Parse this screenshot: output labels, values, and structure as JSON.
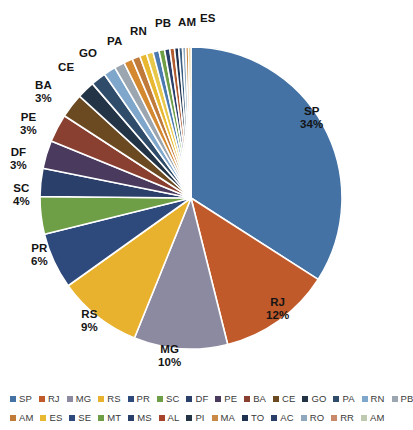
{
  "chart_data": {
    "type": "pie",
    "title": "",
    "subtitle": "",
    "xlabel": "",
    "ylabel": "",
    "legend_position": "bottom",
    "grid": false,
    "units": "%",
    "start_angle_deg": 0,
    "direction": "clockwise",
    "categories": [
      "SP",
      "RJ",
      "MG",
      "RS",
      "PR",
      "SC",
      "DF",
      "PE",
      "BA",
      "CE",
      "GO",
      "PA",
      "RN",
      "PB",
      "AM",
      "ES",
      "SE",
      "MT",
      "MS",
      "AL",
      "PI",
      "MA",
      "TO",
      "AC",
      "RO",
      "RR",
      "AM"
    ],
    "values": [
      34,
      12,
      10,
      9,
      6,
      4,
      3,
      3,
      3,
      2.6,
      1.9,
      1.6,
      1.3,
      1.1,
      0.95,
      0.85,
      0.75,
      0.7,
      0.65,
      0.6,
      0.55,
      0.5,
      0.45,
      0.4,
      0.35,
      0.3,
      0.25
    ],
    "colors": [
      "#4472A4",
      "#C15A2B",
      "#8C8AA0",
      "#E8B12E",
      "#2E4A7D",
      "#6E9E45",
      "#2B3F6B",
      "#4A3A5E",
      "#8A4030",
      "#6B4A22",
      "#243447",
      "#2F4D6B",
      "#7FA6CB",
      "#9BA6B0",
      "#D4882F",
      "#C07A3A",
      "#E8B830",
      "#E8C84A",
      "#4A7AB0",
      "#6E9E45",
      "#2B3F6B",
      "#B05A30",
      "#1F3350",
      "#3A5D80",
      "#8FA8BE",
      "#C98A48",
      "#D6B84A",
      "#B8C9A8"
    ],
    "slices": [
      {
        "label": "SP",
        "value": 34,
        "display": "34%",
        "color": "#4472A4"
      },
      {
        "label": "RJ",
        "value": 12,
        "display": "12%",
        "color": "#C15A2B"
      },
      {
        "label": "MG",
        "value": 10,
        "display": "10%",
        "color": "#8C8AA0"
      },
      {
        "label": "RS",
        "value": 9,
        "display": "9%",
        "color": "#E8B12E"
      },
      {
        "label": "PR",
        "value": 6,
        "display": "6%",
        "color": "#2E4A7D"
      },
      {
        "label": "SC",
        "value": 4,
        "display": "4%",
        "color": "#6E9E45"
      },
      {
        "label": "DF",
        "value": 3,
        "display": "3%",
        "color": "#2B3F6B"
      },
      {
        "label": "PE",
        "value": 3,
        "display": "3%",
        "color": "#8A4030"
      },
      {
        "label": "BA",
        "value": 3,
        "display": "3%",
        "color": "#4A3A5E"
      },
      {
        "label": "CE",
        "value": 2.6,
        "display": "",
        "color": "#6B4A22"
      },
      {
        "label": "GO",
        "value": 1.9,
        "display": "",
        "color": "#243447"
      },
      {
        "label": "PA",
        "value": 1.6,
        "display": "",
        "color": "#2F4D6B"
      },
      {
        "label": "RN",
        "value": 1.3,
        "display": "",
        "color": "#7FA6CB"
      },
      {
        "label": "PB",
        "value": 1.1,
        "display": "",
        "color": "#9BA6B0"
      },
      {
        "label": "AM",
        "value": 0.95,
        "display": "",
        "color": "#C07A3A"
      },
      {
        "label": "ES",
        "value": 0.85,
        "display": "",
        "color": "#E8B830"
      }
    ],
    "labeled_points": [
      {
        "name": "SP",
        "pct": "34%"
      },
      {
        "name": "RJ",
        "pct": "12%"
      },
      {
        "name": "MG",
        "pct": "10%"
      },
      {
        "name": "RS",
        "pct": "9%"
      },
      {
        "name": "PR",
        "pct": "6%"
      },
      {
        "name": "SC",
        "pct": "4%"
      },
      {
        "name": "DF",
        "pct": "3%"
      },
      {
        "name": "PE",
        "pct": "3%"
      },
      {
        "name": "BA",
        "pct": "3%"
      },
      {
        "name": "CE",
        "pct": ""
      },
      {
        "name": "GO",
        "pct": ""
      },
      {
        "name": "PA",
        "pct": ""
      },
      {
        "name": "RN",
        "pct": ""
      },
      {
        "name": "PB",
        "pct": ""
      },
      {
        "name": "AM",
        "pct": ""
      },
      {
        "name": "ES",
        "pct": ""
      }
    ]
  },
  "labels": {
    "sp": {
      "name": "SP",
      "pct": "34%"
    },
    "rj": {
      "name": "RJ",
      "pct": "12%"
    },
    "mg": {
      "name": "MG",
      "pct": "10%"
    },
    "rs": {
      "name": "RS",
      "pct": "9%"
    },
    "pr": {
      "name": "PR",
      "pct": "6%"
    },
    "sc": {
      "name": "SC",
      "pct": "4%"
    },
    "df": {
      "name": "DF",
      "pct": "3%"
    },
    "pe": {
      "name": "PE",
      "pct": "3%"
    },
    "ba": {
      "name": "BA",
      "pct": "3%"
    },
    "ce": {
      "name": "CE"
    },
    "go": {
      "name": "GO"
    },
    "pa": {
      "name": "PA"
    },
    "rn": {
      "name": "RN"
    },
    "pb": {
      "name": "PB"
    },
    "am": {
      "name": "AM"
    },
    "es": {
      "name": "ES"
    }
  },
  "legend": {
    "row1": [
      {
        "label": "SP",
        "color": "#4472A4"
      },
      {
        "label": "RJ",
        "color": "#C15A2B"
      },
      {
        "label": "MG",
        "color": "#8C8AA0"
      },
      {
        "label": "RS",
        "color": "#E8B12E"
      },
      {
        "label": "PR",
        "color": "#2E4A7D"
      },
      {
        "label": "SC",
        "color": "#6E9E45"
      },
      {
        "label": "DF",
        "color": "#2B3F6B"
      },
      {
        "label": "PE",
        "color": "#4A3A5E"
      },
      {
        "label": "BA",
        "color": "#8A4030"
      },
      {
        "label": "CE",
        "color": "#6B4A22"
      },
      {
        "label": "GO",
        "color": "#243447"
      },
      {
        "label": "PA",
        "color": "#2F4D6B"
      },
      {
        "label": "RN",
        "color": "#7FA6CB"
      },
      {
        "label": "PB",
        "color": "#9BA6B0"
      }
    ],
    "row2": [
      {
        "label": "AM",
        "color": "#C07A3A"
      },
      {
        "label": "ES",
        "color": "#E8B830"
      },
      {
        "label": "SE",
        "color": "#2E4A7D"
      },
      {
        "label": "MT",
        "color": "#6E9E45"
      },
      {
        "label": "MS",
        "color": "#2B3F6B"
      },
      {
        "label": "AL",
        "color": "#A8432B"
      },
      {
        "label": "PI",
        "color": "#243447"
      },
      {
        "label": "MA",
        "color": "#C98A48"
      },
      {
        "label": "TO",
        "color": "#1F3350"
      },
      {
        "label": "AC",
        "color": "#2B3F6B"
      },
      {
        "label": "RO",
        "color": "#8FA8BE"
      },
      {
        "label": "RR",
        "color": "#C98A6A"
      },
      {
        "label": "AM",
        "color": "#BFC9B0"
      }
    ]
  }
}
